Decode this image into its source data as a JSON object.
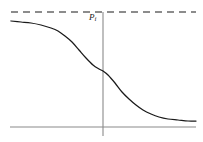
{
  "figure": {
    "width": 203,
    "height": 142,
    "background_color": "#ffffff"
  },
  "labels": {
    "asymptote_main": "P",
    "asymptote_sub": "i"
  },
  "colors": {
    "curve": "#1a1a1a",
    "axis": "#8a8a8a",
    "dashed": "#1a1a1a",
    "background": "#ffffff"
  },
  "chart_data": {
    "type": "line",
    "title": "",
    "subtitle": "",
    "xlabel": "",
    "ylabel": "",
    "grid": false,
    "legend": "none",
    "xlim": [
      -1,
      1
    ],
    "ylim": [
      0,
      1
    ],
    "annotations": [
      {
        "text": "Pi",
        "render": "P with subscript i",
        "style": "italic",
        "x_px": 89,
        "y_px": 13,
        "describes": "upper horizontal dashed asymptote value"
      }
    ],
    "reference_lines": [
      {
        "name": "upper-asymptote",
        "orientation": "horizontal",
        "style": "dashed",
        "y_px": 12,
        "x_start_px": 11,
        "x_end_px": 196,
        "label": "Pi"
      },
      {
        "name": "baseline-axis",
        "orientation": "horizontal",
        "style": "solid",
        "y_px": 127,
        "x_start_px": 10,
        "x_end_px": 196,
        "label": ""
      },
      {
        "name": "inflection-axis",
        "orientation": "vertical",
        "style": "solid",
        "x_px": 103,
        "y_start_px": 12,
        "y_end_px": 136,
        "label": ""
      }
    ],
    "series": [
      {
        "name": "decreasing-sigmoid",
        "style": "solid",
        "points_px": [
          [
            11,
            21
          ],
          [
            21,
            22
          ],
          [
            31,
            23
          ],
          [
            41,
            25
          ],
          [
            51,
            28
          ],
          [
            58,
            31
          ],
          [
            65,
            36
          ],
          [
            72,
            42
          ],
          [
            79,
            50
          ],
          [
            86,
            58
          ],
          [
            93,
            65
          ],
          [
            99,
            69
          ],
          [
            103,
            71
          ],
          [
            108,
            75
          ],
          [
            115,
            83
          ],
          [
            122,
            92
          ],
          [
            129,
            99
          ],
          [
            136,
            105
          ],
          [
            143,
            110
          ],
          [
            151,
            114
          ],
          [
            159,
            117
          ],
          [
            168,
            119
          ],
          [
            178,
            120
          ],
          [
            188,
            121
          ],
          [
            196,
            121
          ]
        ],
        "x": [
          -1.0,
          -0.9,
          -0.8,
          -0.7,
          -0.6,
          -0.52,
          -0.45,
          -0.37,
          -0.29,
          -0.21,
          -0.13,
          -0.06,
          0.0,
          0.06,
          0.13,
          0.21,
          0.29,
          0.37,
          0.45,
          0.52,
          0.6,
          0.7,
          0.8,
          0.9,
          1.0
        ],
        "values": [
          0.96,
          0.95,
          0.93,
          0.91,
          0.88,
          0.85,
          0.81,
          0.76,
          0.69,
          0.62,
          0.55,
          0.51,
          0.49,
          0.46,
          0.4,
          0.32,
          0.26,
          0.21,
          0.16,
          0.13,
          0.11,
          0.08,
          0.07,
          0.06,
          0.06
        ]
      }
    ]
  }
}
